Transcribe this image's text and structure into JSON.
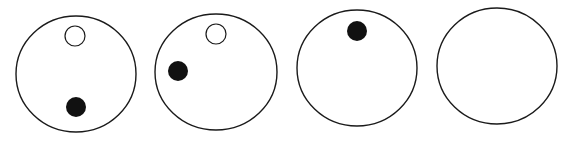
{
  "canvas": {
    "width": 564,
    "height": 146,
    "background": "#ffffff"
  },
  "colors": {
    "stroke": "#1a1a1a",
    "dot_fill": "#111111",
    "open_fill": "#ffffff"
  },
  "panels": [
    {
      "id": "panel-1",
      "outer": {
        "cx": 76,
        "cy": 74,
        "rx": 60,
        "ry": 58
      },
      "open_dot": {
        "cx": 75,
        "cy": 36,
        "r": 10
      },
      "filled_dot": {
        "cx": 76,
        "cy": 107,
        "r": 10
      }
    },
    {
      "id": "panel-2",
      "outer": {
        "cx": 216,
        "cy": 72,
        "rx": 61,
        "ry": 58
      },
      "open_dot": {
        "cx": 216,
        "cy": 34,
        "r": 10
      },
      "filled_dot": {
        "cx": 178,
        "cy": 71,
        "r": 10
      }
    },
    {
      "id": "panel-3",
      "outer": {
        "cx": 357,
        "cy": 68,
        "rx": 60,
        "ry": 58
      },
      "open_dot": null,
      "filled_dot": {
        "cx": 357,
        "cy": 31,
        "r": 10
      }
    },
    {
      "id": "panel-4",
      "outer": {
        "cx": 497,
        "cy": 66,
        "rx": 60,
        "ry": 58
      },
      "open_dot": null,
      "filled_dot": null
    }
  ]
}
